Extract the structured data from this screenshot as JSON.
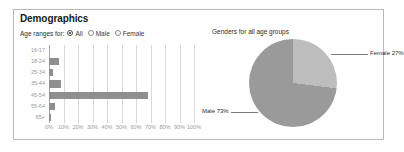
{
  "panel": {
    "title": "Demographics"
  },
  "filter": {
    "label": "Age ranges for:",
    "options": [
      {
        "label": "All",
        "selected": true
      },
      {
        "label": "Male",
        "selected": false
      },
      {
        "label": "Female",
        "selected": false
      }
    ]
  },
  "colors": {
    "bar": "#8f8f8f",
    "pie_male": "#9a9a9a",
    "pie_female": "#bdbdbd",
    "grid": "#d8d8d8",
    "axis": "#a5a5a5",
    "panel_border": "#b9b9b9",
    "tick_text": "#9a9a9a",
    "body_text": "#2b2b2b"
  },
  "chart_data": [
    {
      "type": "bar",
      "orientation": "horizontal",
      "title": "",
      "xlabel": "",
      "ylabel": "",
      "categories": [
        "16-17",
        "18-24",
        "25-34",
        "35-44",
        "45-54",
        "55-64",
        "65+"
      ],
      "values": [
        0,
        7,
        3,
        8,
        68,
        4,
        1.5
      ],
      "xlim": [
        0,
        100
      ],
      "xticks": [
        0,
        10,
        20,
        30,
        40,
        50,
        60,
        70,
        80,
        90,
        100
      ],
      "xticklabels": [
        "0%",
        "10%",
        "20%",
        "30%",
        "40%",
        "50%",
        "60%",
        "70%",
        "80%",
        "90%",
        "100%"
      ],
      "grid": true,
      "legend": "none"
    },
    {
      "type": "pie",
      "title": "Genders for all age groups",
      "labels": [
        "Male",
        "Female"
      ],
      "values": [
        73,
        27
      ],
      "annotations": [
        "Male 73%",
        "Female 27%"
      ],
      "legend": "none"
    }
  ]
}
